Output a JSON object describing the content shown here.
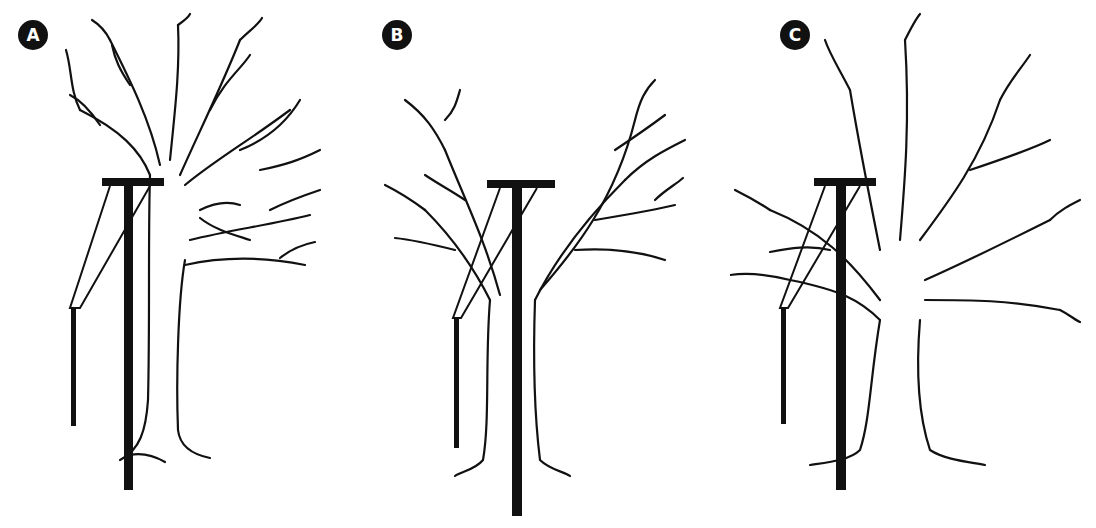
{
  "figure": {
    "panels": [
      {
        "label": "A",
        "description": "Tree with T-shaped utility pole in front of trunk and diagonal brace, crown unpruned"
      },
      {
        "label": "B",
        "description": "Tree with V-crotch pruning around T-shaped utility pole"
      },
      {
        "label": "C",
        "description": "Large tree with side pruning, pole beside trunk with lateral branches passing through"
      }
    ],
    "colors": {
      "ink": "#111111",
      "background": "#ffffff",
      "badge_text": "#ffffff"
    }
  }
}
